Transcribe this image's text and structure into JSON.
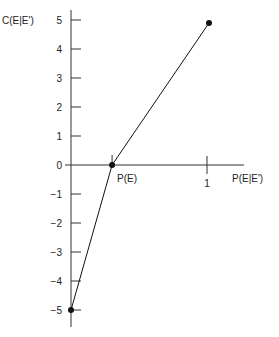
{
  "chart_data": {
    "type": "line",
    "title": "",
    "xlabel": "P(E|E')",
    "ylabel": "C(E|E')",
    "x_ticks": [
      {
        "value": 1,
        "label": "1"
      }
    ],
    "x_annotations": [
      {
        "value": 0.28,
        "label": "P(E)"
      }
    ],
    "y_ticks": [
      5,
      4,
      3,
      2,
      1,
      0,
      -1,
      -2,
      -3,
      -4,
      -5
    ],
    "y_tick_labels": [
      "5",
      "4",
      "3",
      "2",
      "1",
      "0",
      "−1",
      "−2",
      "−3",
      "−4",
      "−5"
    ],
    "ylim": [
      -5.5,
      5.5
    ],
    "xlim": [
      0,
      1.35
    ],
    "grid": false,
    "series": [
      {
        "name": "C(E|E')",
        "points": [
          {
            "x": 0,
            "y": -5
          },
          {
            "x": 0.28,
            "y": 0
          },
          {
            "x": 1,
            "y": 5
          }
        ],
        "markers": true,
        "color": "#111111"
      }
    ]
  }
}
